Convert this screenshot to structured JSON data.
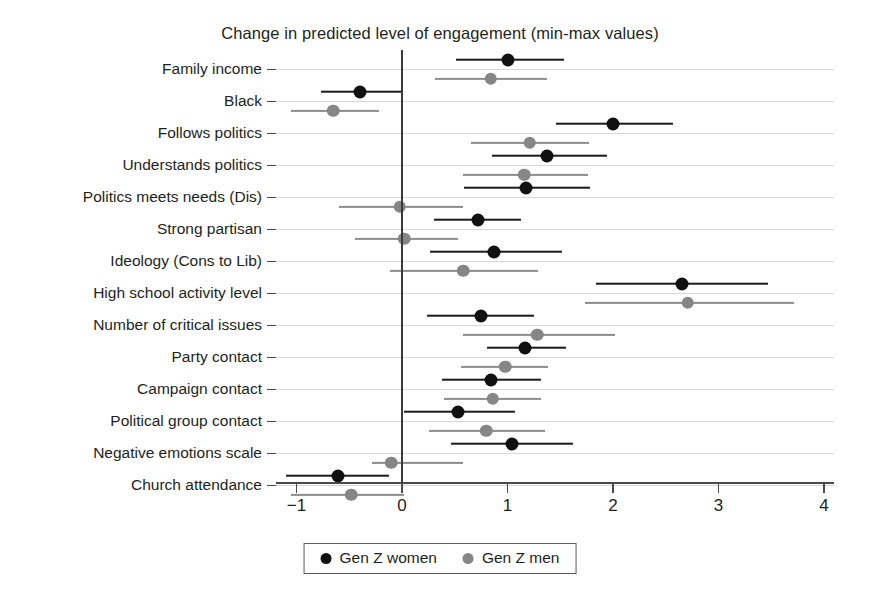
{
  "chart_data": {
    "type": "scatter",
    "title": "Change in predicted level of engagement (min-max values)",
    "xlabel": "",
    "ylabel": "",
    "xlim": [
      -1.35,
      4.1
    ],
    "xticks": [
      -1,
      0,
      1,
      2,
      3,
      4
    ],
    "xtick_labels": [
      "−1",
      "0",
      "1",
      "2",
      "3",
      "4"
    ],
    "grid": true,
    "legend_position": "bottom",
    "zero_reference_line": 0,
    "colors": {
      "women": "#111111",
      "men": "#868686",
      "grid": "#c9c9c9",
      "axis": "#4a4a4a"
    },
    "series": [
      {
        "name": "Gen Z women",
        "key": "women",
        "marker": "filled-circle-black"
      },
      {
        "name": "Gen Z men",
        "key": "men",
        "marker": "filled-circle-gray"
      }
    ],
    "categories": [
      "Family income",
      "Black",
      "Follows politics",
      "Understands politics",
      "Politics meets needs (Dis)",
      "Strong partisan",
      "Ideology (Cons to Lib)",
      "High school activity level",
      "Number of critical issues",
      "Party contact",
      "Campaign contact",
      "Political group contact",
      "Negative emotions scale",
      "Church attendance"
    ],
    "points": [
      {
        "category": "Family income",
        "women": {
          "estimate": 1.0,
          "low": 0.51,
          "high": 1.54
        },
        "men": {
          "estimate": 0.84,
          "low": 0.31,
          "high": 1.37
        }
      },
      {
        "category": "Black",
        "women": {
          "estimate": -0.4,
          "low": -0.77,
          "high": 0.0
        },
        "men": {
          "estimate": -0.65,
          "low": -1.05,
          "high": -0.22
        }
      },
      {
        "category": "Follows politics",
        "women": {
          "estimate": 2.0,
          "low": 1.46,
          "high": 2.57
        },
        "men": {
          "estimate": 1.21,
          "low": 0.65,
          "high": 1.77
        }
      },
      {
        "category": "Understands politics",
        "women": {
          "estimate": 1.37,
          "low": 0.85,
          "high": 1.94
        },
        "men": {
          "estimate": 1.16,
          "low": 0.58,
          "high": 1.76
        }
      },
      {
        "category": "Politics meets needs (Dis)",
        "women": {
          "estimate": 1.18,
          "low": 0.59,
          "high": 1.78
        },
        "men": {
          "estimate": -0.02,
          "low": -0.6,
          "high": 0.58
        }
      },
      {
        "category": "Strong partisan",
        "women": {
          "estimate": 0.72,
          "low": 0.3,
          "high": 1.13
        },
        "men": {
          "estimate": 0.02,
          "low": -0.45,
          "high": 0.53
        }
      },
      {
        "category": "Ideology (Cons to Lib)",
        "women": {
          "estimate": 0.87,
          "low": 0.27,
          "high": 1.52
        },
        "men": {
          "estimate": 0.58,
          "low": -0.11,
          "high": 1.29
        }
      },
      {
        "category": "High school activity level",
        "women": {
          "estimate": 2.65,
          "low": 1.84,
          "high": 3.47
        },
        "men": {
          "estimate": 2.71,
          "low": 1.73,
          "high": 3.72
        }
      },
      {
        "category": "Number of critical issues",
        "women": {
          "estimate": 0.75,
          "low": 0.24,
          "high": 1.25
        },
        "men": {
          "estimate": 1.28,
          "low": 0.58,
          "high": 2.02
        }
      },
      {
        "category": "Party contact",
        "women": {
          "estimate": 1.17,
          "low": 0.81,
          "high": 1.55
        },
        "men": {
          "estimate": 0.98,
          "low": 0.56,
          "high": 1.38
        }
      },
      {
        "category": "Campaign contact",
        "women": {
          "estimate": 0.84,
          "low": 0.38,
          "high": 1.32
        },
        "men": {
          "estimate": 0.86,
          "low": 0.4,
          "high": 1.32
        }
      },
      {
        "category": "Political group contact",
        "women": {
          "estimate": 0.53,
          "low": 0.02,
          "high": 1.07
        },
        "men": {
          "estimate": 0.8,
          "low": 0.26,
          "high": 1.36
        }
      },
      {
        "category": "Negative emotions scale",
        "women": {
          "estimate": 1.04,
          "low": 0.46,
          "high": 1.62
        },
        "men": {
          "estimate": -0.1,
          "low": -0.28,
          "high": 0.58
        }
      },
      {
        "category": "Church attendance",
        "women": {
          "estimate": -0.61,
          "low": -1.1,
          "high": -0.12
        },
        "men": {
          "estimate": -0.48,
          "low": -1.05,
          "high": 0.02
        }
      }
    ]
  }
}
